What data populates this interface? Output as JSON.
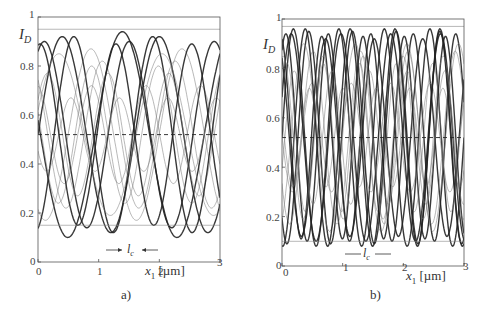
{
  "chart_data": [
    {
      "type": "line",
      "panel_label": "a)",
      "title": "",
      "xlabel": "x1 [µm]",
      "ylabel": "I_D",
      "xlim": [
        0,
        3
      ],
      "ylim": [
        0,
        1
      ],
      "x_ticks": [
        "0",
        "1",
        "2",
        "3"
      ],
      "y_ticks": [
        "0",
        "0.2",
        "0.4",
        "0.6",
        "0.8",
        "1"
      ],
      "grid": false,
      "legend": null,
      "annotations": [
        "l_c (coherence length marker, arrows pointing inward)",
        "dashed horizontal line at I_D ≈ 0.52 (mean)"
      ],
      "mean_line": 0.52,
      "description": "Many overlapping sinusoidal interference curves; envelope ranges ~0.15 to ~0.95; periods larger (longer fringes)",
      "envelope": {
        "min": 0.15,
        "max": 0.95
      },
      "series": [
        {
          "name": "curve-1",
          "amp": 0.4,
          "period": 1.6,
          "phase": 0.0,
          "bold": true
        },
        {
          "name": "curve-2",
          "amp": 0.38,
          "period": 1.4,
          "phase": 1.1,
          "bold": true
        },
        {
          "name": "curve-3",
          "amp": 0.3,
          "period": 1.2,
          "phase": 2.3,
          "bold": false
        },
        {
          "name": "curve-4",
          "amp": 0.42,
          "period": 1.8,
          "phase": 3.0,
          "bold": true
        },
        {
          "name": "curve-5",
          "amp": 0.25,
          "period": 1.0,
          "phase": 0.6,
          "bold": false
        },
        {
          "name": "curve-6",
          "amp": 0.35,
          "period": 1.5,
          "phase": 4.2,
          "bold": false
        },
        {
          "name": "curve-7",
          "amp": 0.2,
          "period": 0.9,
          "phase": 1.7,
          "bold": false
        },
        {
          "name": "curve-8",
          "amp": 0.4,
          "period": 1.3,
          "phase": 5.0,
          "bold": true
        },
        {
          "name": "curve-9",
          "amp": 0.28,
          "period": 1.1,
          "phase": 2.8,
          "bold": false
        },
        {
          "name": "curve-10",
          "amp": 0.33,
          "period": 1.7,
          "phase": 0.3,
          "bold": false
        },
        {
          "name": "curve-11",
          "amp": 0.15,
          "period": 0.8,
          "phase": 3.6,
          "bold": false
        },
        {
          "name": "curve-12",
          "amp": 0.37,
          "period": 1.25,
          "phase": 1.4,
          "bold": true
        }
      ]
    },
    {
      "type": "line",
      "panel_label": "b)",
      "title": "",
      "xlabel": "x1 [µm]",
      "ylabel": "I_D",
      "xlim": [
        0,
        3
      ],
      "ylim": [
        0,
        1
      ],
      "x_ticks": [
        "0",
        "1",
        "2",
        "3"
      ],
      "y_ticks": [
        "0",
        "0.2",
        "0.4",
        "0.6",
        "0.8",
        "1"
      ],
      "grid": false,
      "legend": null,
      "annotations": [
        "l_c (coherence length marker, arrows pointing outward)",
        "dashed horizontal line at I_D ≈ 0.52 (mean)"
      ],
      "mean_line": 0.52,
      "description": "Denser overlapping sinusoidal interference curves with shorter periods; envelope ranges ~0.10 to ~0.97",
      "envelope": {
        "min": 0.1,
        "max": 0.97
      },
      "series": [
        {
          "name": "curve-1",
          "amp": 0.44,
          "period": 0.75,
          "phase": 0.0,
          "bold": true
        },
        {
          "name": "curve-2",
          "amp": 0.42,
          "period": 0.7,
          "phase": 1.0,
          "bold": true
        },
        {
          "name": "curve-3",
          "amp": 0.4,
          "period": 0.8,
          "phase": 2.2,
          "bold": true
        },
        {
          "name": "curve-4",
          "amp": 0.22,
          "period": 0.65,
          "phase": 3.1,
          "bold": false
        },
        {
          "name": "curve-5",
          "amp": 0.43,
          "period": 0.72,
          "phase": 4.0,
          "bold": true
        },
        {
          "name": "curve-6",
          "amp": 0.3,
          "period": 0.6,
          "phase": 0.7,
          "bold": false
        },
        {
          "name": "curve-7",
          "amp": 0.38,
          "period": 0.85,
          "phase": 5.2,
          "bold": false
        },
        {
          "name": "curve-8",
          "amp": 0.41,
          "period": 0.68,
          "phase": 1.8,
          "bold": true
        },
        {
          "name": "curve-9",
          "amp": 0.2,
          "period": 0.55,
          "phase": 2.7,
          "bold": false
        },
        {
          "name": "curve-10",
          "amp": 0.35,
          "period": 0.78,
          "phase": 3.7,
          "bold": false
        },
        {
          "name": "curve-11",
          "amp": 0.44,
          "period": 0.74,
          "phase": 4.6,
          "bold": true
        },
        {
          "name": "curve-12",
          "amp": 0.27,
          "period": 0.62,
          "phase": 5.8,
          "bold": false
        },
        {
          "name": "curve-13",
          "amp": 0.42,
          "period": 0.82,
          "phase": 0.4,
          "bold": true
        },
        {
          "name": "curve-14",
          "amp": 0.33,
          "period": 0.66,
          "phase": 1.4,
          "bold": false
        }
      ]
    }
  ],
  "panels": {
    "a": {
      "caption": "a)",
      "ylabel_main": "I",
      "ylabel_sub": "D",
      "xlabel_var": "x",
      "xlabel_sub": "1",
      "xlabel_unit": "[µm]",
      "lc_main": "l",
      "lc_sub": "c",
      "yticks": [
        "1",
        "0.8",
        "0.6",
        "0.4",
        "0.2",
        "0"
      ],
      "xticks": [
        "0",
        "1",
        "2",
        "3"
      ]
    },
    "b": {
      "caption": "b)",
      "ylabel_main": "I",
      "ylabel_sub": "D",
      "xlabel_var": "x",
      "xlabel_sub": "1",
      "xlabel_unit": "[µm]",
      "lc_main": "l",
      "lc_sub": "c",
      "yticks": [
        "1",
        "0.8",
        "0.6",
        "0.4",
        "0.2",
        "0"
      ],
      "xticks": [
        "0",
        "1",
        "2",
        "3"
      ]
    }
  }
}
